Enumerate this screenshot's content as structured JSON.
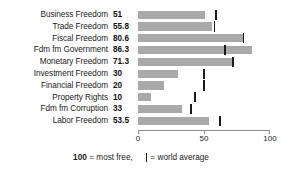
{
  "chart_data": {
    "type": "bar",
    "title": "",
    "subtitle": "",
    "xlabel": "",
    "ylabel": "",
    "orientation": "horizontal",
    "xlim": [
      0,
      100
    ],
    "grid": false,
    "axis_ticks": [
      {
        "value": 0,
        "label": "0"
      },
      {
        "value": 50,
        "label": "50"
      },
      {
        "value": 100,
        "label": "100"
      }
    ],
    "bar_color": "#a9a9a9",
    "marker_color": "#1a1a1a",
    "categories": [
      "Business Freedom",
      "Trade Freedom",
      "Fiscal Freedom",
      "Fdm fm Government",
      "Monetary Freedom",
      "Investment Freedom",
      "Financial Freedom",
      "Property Rights",
      "Fdm fm Corruption",
      "Labor Freedom"
    ],
    "values": [
      51,
      55.8,
      80.6,
      86.3,
      71.3,
      30,
      20,
      10,
      33,
      53.5
    ],
    "value_labels": [
      "51",
      "55.8",
      "80.6",
      "86.3",
      "71.3",
      "30",
      "20",
      "10",
      "33",
      "53.5"
    ],
    "world_average": [
      59,
      58,
      80,
      66,
      72,
      50,
      50,
      43,
      40,
      62
    ],
    "series": [
      {
        "name": "Country score",
        "values": [
          51,
          55.8,
          80.6,
          86.3,
          71.3,
          30,
          20,
          10,
          33,
          53.5
        ]
      },
      {
        "name": "world average",
        "values": [
          59,
          58,
          80,
          66,
          72,
          50,
          50,
          43,
          40,
          62
        ]
      }
    ],
    "rows": [
      {
        "label": "Business Freedom",
        "value_label": "51",
        "value": 51,
        "world_average": 59
      },
      {
        "label": "Trade Freedom",
        "value_label": "55.8",
        "value": 55.8,
        "world_average": 58
      },
      {
        "label": "Fiscal Freedom",
        "value_label": "80.6",
        "value": 80.6,
        "world_average": 80
      },
      {
        "label": "Fdm fm Government",
        "value_label": "86.3",
        "value": 86.3,
        "world_average": 66
      },
      {
        "label": "Monetary Freedom",
        "value_label": "71.3",
        "value": 71.3,
        "world_average": 72
      },
      {
        "label": "Investment Freedom",
        "value_label": "30",
        "value": 30,
        "world_average": 50
      },
      {
        "label": "Financial Freedom",
        "value_label": "20",
        "value": 20,
        "world_average": 50
      },
      {
        "label": "Property Rights",
        "value_label": "10",
        "value": 10,
        "world_average": 43
      },
      {
        "label": "Fdm fm Corruption",
        "value_label": "33",
        "value": 33,
        "world_average": 40
      },
      {
        "label": "Labor Freedom",
        "value_label": "53.5",
        "value": 53.5,
        "world_average": 62
      }
    ],
    "legend_position": "bottom",
    "legend": {
      "most_free_value": "100",
      "most_free_text": "= most free,",
      "world_average_text": "= world average"
    }
  }
}
